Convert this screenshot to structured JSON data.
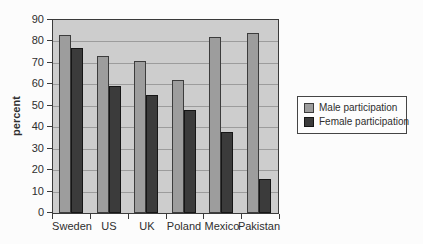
{
  "chart_data": {
    "type": "bar",
    "title": "",
    "xlabel": "",
    "ylabel": "percent",
    "categories": [
      "Sweden",
      "US",
      "UK",
      "Poland",
      "Mexico",
      "Pakistan"
    ],
    "series": [
      {
        "name": "Male participation",
        "color": "#9d9d9d",
        "border_color": "#3c3c3c",
        "values": [
          83,
          73,
          71,
          62,
          82,
          84
        ]
      },
      {
        "name": "Female participation",
        "color": "#3b3b3b",
        "border_color": "#161616",
        "values": [
          77,
          59,
          55,
          48,
          38,
          16
        ]
      }
    ],
    "ylim": [
      0,
      90
    ],
    "yticks": [
      0,
      10,
      20,
      30,
      40,
      50,
      60,
      70,
      80,
      90
    ],
    "grid": true,
    "legend_position": "right",
    "plot_bg_color": "#cdcdcd",
    "grid_color": "#9c9c9c",
    "axis_color": "#3a3a3a",
    "page_bg_color": "#fcfcfc"
  }
}
